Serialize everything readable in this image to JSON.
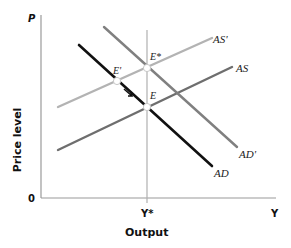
{
  "diagram": {
    "type": "AS-AD economics diagram",
    "axes": {
      "y_axis_symbol": "P",
      "y_axis_title": "Price level",
      "x_axis_symbol": "Y",
      "x_axis_title": "Output",
      "origin_label": "0",
      "x_tick_label": "Y*"
    },
    "curves": [
      {
        "id": "AD_prime",
        "label": "AD'",
        "color": "#808080"
      },
      {
        "id": "AD",
        "label": "AD",
        "color": "#111111"
      },
      {
        "id": "AS_prime",
        "label": "AS'",
        "color": "#b3b3b3"
      },
      {
        "id": "AS",
        "label": "AS",
        "color": "#6e6e6e"
      }
    ],
    "points": [
      {
        "id": "E_star",
        "label": "E*"
      },
      {
        "id": "E",
        "label": "E"
      },
      {
        "id": "E_prime",
        "label": "E'"
      }
    ],
    "guide_line": {
      "label": "potential output line at Y*",
      "color": "#b0b0b0"
    }
  }
}
